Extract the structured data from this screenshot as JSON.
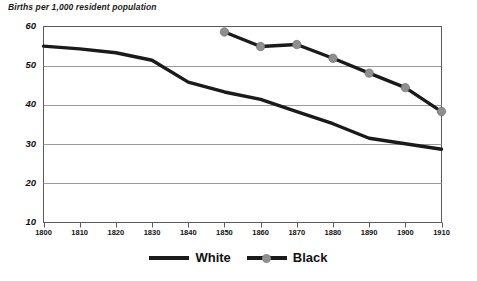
{
  "chart_data": {
    "type": "line",
    "title": "Births per 1,000 resident population",
    "xlabel": "",
    "ylabel": "Births per 1,000 resident population",
    "xlim": [
      1800,
      1910
    ],
    "ylim": [
      10,
      60
    ],
    "xticks": [
      1800,
      1810,
      1820,
      1830,
      1840,
      1850,
      1860,
      1870,
      1880,
      1890,
      1900,
      1910
    ],
    "yticks": [
      10,
      20,
      30,
      40,
      50,
      60
    ],
    "grid": true,
    "legend_position": "bottom",
    "series": [
      {
        "name": "White",
        "marker": "none",
        "color": "#1a1a1a",
        "x": [
          1800,
          1810,
          1820,
          1830,
          1840,
          1850,
          1860,
          1870,
          1880,
          1890,
          1900,
          1910
        ],
        "values": [
          55.0,
          54.3,
          53.3,
          51.4,
          45.8,
          43.3,
          41.4,
          38.3,
          35.2,
          31.5,
          30.1,
          28.7
        ]
      },
      {
        "name": "Black",
        "marker": "circle",
        "color": "#1a1a1a",
        "marker_color": "#8f8f8f",
        "x": [
          1850,
          1860,
          1870,
          1880,
          1890,
          1900,
          1910
        ],
        "values": [
          58.6,
          54.9,
          55.4,
          51.9,
          48.1,
          44.4,
          38.3
        ]
      }
    ]
  },
  "axis": {
    "y_tick_labels": [
      "60",
      "50",
      "40",
      "30",
      "20",
      "10"
    ],
    "x_tick_labels": [
      "1800",
      "1810",
      "1820",
      "1830",
      "1840",
      "1850",
      "1860",
      "1870",
      "1880",
      "1890",
      "1900",
      "1910"
    ]
  },
  "legend": {
    "items": [
      {
        "label": "White"
      },
      {
        "label": "Black"
      }
    ]
  },
  "colors": {
    "line": "#1a1a1a",
    "marker": "#8f8f8f",
    "grid": "#9a9a9a",
    "frame": "#5a5a5a",
    "text": "#111111",
    "background": "#ffffff"
  }
}
